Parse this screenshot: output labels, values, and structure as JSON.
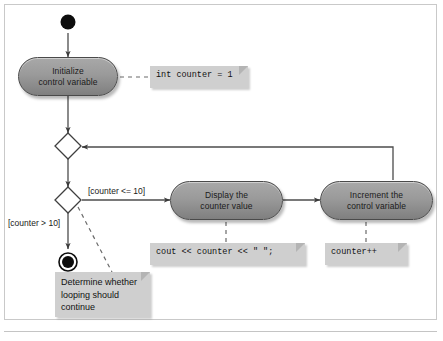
{
  "diagram": {
    "type": "uml-activity-diagram",
    "colors": {
      "action_fill_light": "#a8a8a8",
      "action_fill_dark": "#7f7f7f",
      "action_stroke": "#4a4a4a",
      "note_fill": "#cfcfcf",
      "line": "#4c4c4c",
      "frame": "#c9c9c9",
      "terminal": "#000000"
    }
  },
  "nodes": {
    "initial": {
      "name": "initial-node",
      "shape": "filled-circle"
    },
    "final": {
      "name": "final-node",
      "shape": "bullseye-circle"
    },
    "merge": {
      "name": "merge-diamond",
      "shape": "diamond"
    },
    "decision": {
      "name": "decision-diamond",
      "shape": "diamond"
    },
    "actions": [
      {
        "id": "initialize",
        "line1": "Initialize",
        "line2": "control variable"
      },
      {
        "id": "display",
        "line1": "Display the",
        "line2": "counter value"
      },
      {
        "id": "increment",
        "line1": "Increment the",
        "line2": "control variable"
      }
    ]
  },
  "notes": [
    {
      "id": "note-initialize",
      "text": "int counter = 1"
    },
    {
      "id": "note-display",
      "text": "cout << counter << \" \";"
    },
    {
      "id": "note-increment",
      "text": "counter++"
    },
    {
      "id": "note-decision",
      "text": "Determine whether\nlooping should\ncontinue"
    }
  ],
  "guards": [
    {
      "id": "guard-continue",
      "text": "[counter <= 10]"
    },
    {
      "id": "guard-exit",
      "text": "[counter > 10]"
    }
  ]
}
